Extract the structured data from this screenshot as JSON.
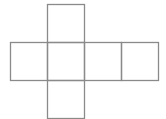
{
  "diagram": {
    "type": "cube-net",
    "stroke_color": "#8a8a8a",
    "background": "#ffffff",
    "faces": [
      {
        "id": "top",
        "x": 47,
        "y": 4,
        "w": 37,
        "h": 38
      },
      {
        "id": "left",
        "x": 10,
        "y": 42,
        "w": 37,
        "h": 38
      },
      {
        "id": "center",
        "x": 47,
        "y": 42,
        "w": 37,
        "h": 38
      },
      {
        "id": "right-1",
        "x": 84,
        "y": 42,
        "w": 37,
        "h": 38
      },
      {
        "id": "right-2",
        "x": 121,
        "y": 42,
        "w": 37,
        "h": 38
      },
      {
        "id": "bottom",
        "x": 47,
        "y": 80,
        "w": 37,
        "h": 38
      }
    ]
  }
}
